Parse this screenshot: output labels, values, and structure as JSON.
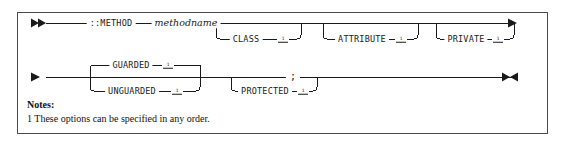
{
  "diagram": {
    "type": "railroad-syntax-diagram",
    "line_color": "#1a1a1a",
    "border_color": "#4a4a4a",
    "start_marker": "▶▶",
    "continue_marker": "▶",
    "end_marker": "▶◀",
    "rows": [
      {
        "id": "row-1",
        "start": "▶▶",
        "end": "▶",
        "main_tokens": [
          {
            "id": "tok-method",
            "label": "::METHOD",
            "style": "keyword"
          },
          {
            "id": "tok-methodname",
            "label": "methodname",
            "style": "variable"
          }
        ],
        "optional_branches": [
          {
            "id": "opt-class",
            "label": "CLASS",
            "footnote": "1"
          },
          {
            "id": "opt-attribute",
            "label": "ATTRIBUTE",
            "footnote": "1"
          },
          {
            "id": "opt-private",
            "label": "PRIVATE",
            "footnote": "1"
          }
        ]
      },
      {
        "id": "row-2",
        "start": "▶",
        "end": "▶◀",
        "choice_group": [
          {
            "id": "opt-guarded",
            "label": "GUARDED",
            "footnote": "1",
            "position": "above"
          },
          {
            "id": "opt-unguarded",
            "label": "UNGUARDED",
            "footnote": "1",
            "position": "below"
          }
        ],
        "optional_branches": [
          {
            "id": "opt-protected",
            "label": "PROTECTED",
            "footnote": "1"
          }
        ],
        "main_tokens": [
          {
            "id": "tok-semicolon",
            "label": ";",
            "style": "punct"
          }
        ]
      }
    ]
  },
  "notes": {
    "heading": "Notes:",
    "items": [
      "1 These options can be specified in any order."
    ]
  }
}
